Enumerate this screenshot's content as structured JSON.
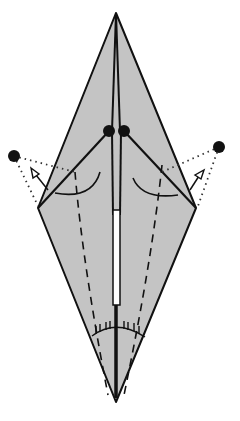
{
  "diagram": {
    "colors": {
      "paper": "#c4c4c4",
      "line": "#111111",
      "background": "#ffffff",
      "slit": "#ffffff"
    },
    "paper_outline": {
      "top": [
        116,
        13
      ],
      "left": [
        38,
        208
      ],
      "bottom": [
        116,
        402
      ],
      "right": [
        196,
        208
      ]
    },
    "reference_points": [
      {
        "name": "left-center-dot",
        "x": 109,
        "y": 131
      },
      {
        "name": "right-center-dot",
        "x": 124,
        "y": 131
      },
      {
        "name": "left-outer-dot",
        "x": 14,
        "y": 156
      },
      {
        "name": "right-outer-dot",
        "x": 219,
        "y": 147
      }
    ],
    "arrows": [
      {
        "name": "left-swing-arrow",
        "direction": "up-left"
      },
      {
        "name": "right-swing-arrow",
        "direction": "up-right"
      }
    ],
    "fold_lines": {
      "valley_dashed": 2,
      "dotted_guides": 4,
      "hash_marked_arc": 1
    }
  }
}
